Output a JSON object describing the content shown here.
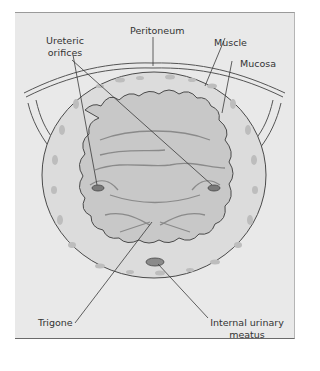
{
  "figure": {
    "type": "anatomical-illustration",
    "labels": {
      "peritoneum": "Peritoneum",
      "ureteric_orifices_line1": "Ureteric",
      "ureteric_orifices_line2": "orifices",
      "muscle": "Muscle",
      "mucosa": "Mucosa",
      "trigone": "Trigone",
      "internal_urinary_meatus_line1": "Internal urinary",
      "internal_urinary_meatus_line2": "meatus"
    },
    "colors": {
      "background": "#e9e9e9",
      "mucosa_fill": "#c8c8c8",
      "muscle_fill": "#dcdcdc",
      "spots": "#b9b9b9",
      "outline": "#4a4a4a"
    }
  }
}
